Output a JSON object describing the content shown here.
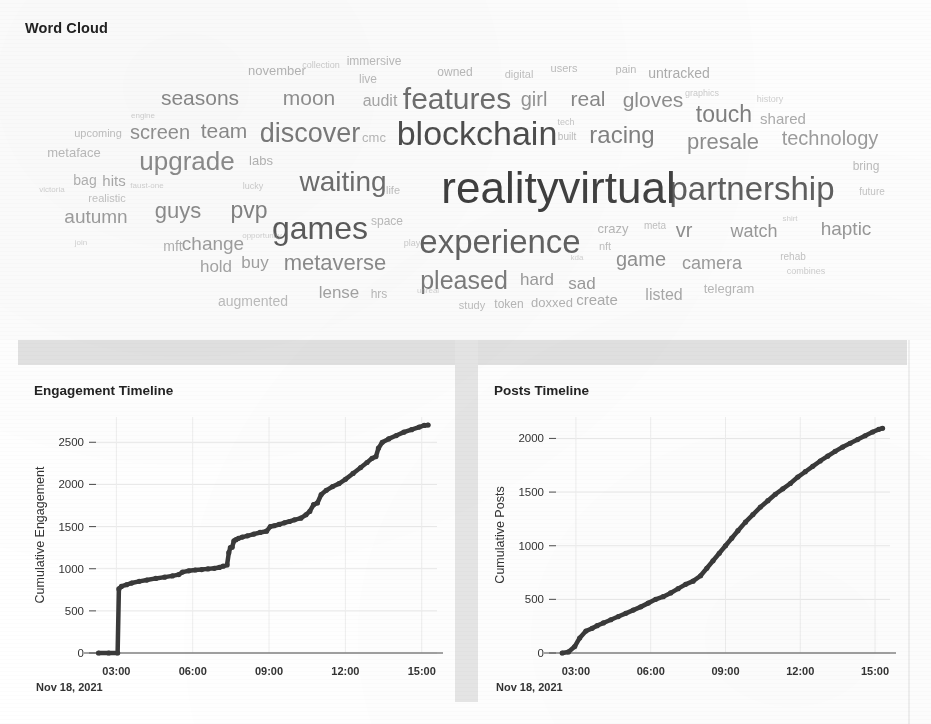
{
  "wordcloud": {
    "title": "Word Cloud",
    "words": [
      {
        "text": "reality",
        "size": 44,
        "x": 500,
        "y": 188,
        "w": 0.98,
        "c": "#3b3b3b"
      },
      {
        "text": "virtual",
        "size": 44,
        "x": 617,
        "y": 188,
        "w": 0.97,
        "c": "#3b3b3b"
      },
      {
        "text": "blockchain",
        "size": 34,
        "x": 477,
        "y": 133,
        "w": 0.92,
        "c": "#3f3f3f"
      },
      {
        "text": "partnership",
        "size": 33,
        "x": 752,
        "y": 188,
        "w": 0.88,
        "c": "#4a4a4a"
      },
      {
        "text": "experience",
        "size": 33,
        "x": 500,
        "y": 241,
        "w": 0.87,
        "c": "#4c4c4c"
      },
      {
        "text": "features",
        "size": 30,
        "x": 457,
        "y": 99,
        "w": 0.85,
        "c": "#565656"
      },
      {
        "text": "games",
        "size": 32,
        "x": 320,
        "y": 228,
        "w": 0.86,
        "c": "#414141"
      },
      {
        "text": "waiting",
        "size": 28,
        "x": 343,
        "y": 182,
        "w": 0.82,
        "c": "#4e4e4e"
      },
      {
        "text": "discover",
        "size": 27,
        "x": 310,
        "y": 133,
        "w": 0.8,
        "c": "#5a5a5a"
      },
      {
        "text": "upgrade",
        "size": 26,
        "x": 187,
        "y": 161,
        "w": 0.78,
        "c": "#6b6b6b"
      },
      {
        "text": "metaverse",
        "size": 22,
        "x": 335,
        "y": 263,
        "w": 0.72,
        "c": "#606060"
      },
      {
        "text": "pleased",
        "size": 25,
        "x": 464,
        "y": 280,
        "w": 0.74,
        "c": "#4f4f4f"
      },
      {
        "text": "technology",
        "size": 20,
        "x": 830,
        "y": 138,
        "w": 0.68,
        "c": "#6e6e6e"
      },
      {
        "text": "presale",
        "size": 22,
        "x": 723,
        "y": 142,
        "w": 0.7,
        "c": "#5e5e5e"
      },
      {
        "text": "racing",
        "size": 24,
        "x": 622,
        "y": 135,
        "w": 0.72,
        "c": "#525252"
      },
      {
        "text": "touch",
        "size": 23,
        "x": 724,
        "y": 114,
        "w": 0.71,
        "c": "#4d4d4d"
      },
      {
        "text": "gloves",
        "size": 21,
        "x": 653,
        "y": 99,
        "w": 0.69,
        "c": "#5c5c5c"
      },
      {
        "text": "seasons",
        "size": 21,
        "x": 200,
        "y": 97,
        "w": 0.7,
        "c": "#585858"
      },
      {
        "text": "screen",
        "size": 20,
        "x": 160,
        "y": 132,
        "w": 0.67,
        "c": "#5b5b5b"
      },
      {
        "text": "team",
        "size": 21,
        "x": 224,
        "y": 130,
        "w": 0.68,
        "c": "#555555"
      },
      {
        "text": "moon",
        "size": 21,
        "x": 309,
        "y": 97,
        "w": 0.68,
        "c": "#5c5c5c"
      },
      {
        "text": "guys",
        "size": 22,
        "x": 178,
        "y": 211,
        "w": 0.69,
        "c": "#5a5a5a"
      },
      {
        "text": "pvp",
        "size": 23,
        "x": 249,
        "y": 210,
        "w": 0.7,
        "c": "#4f4f4f"
      },
      {
        "text": "game",
        "size": 20,
        "x": 641,
        "y": 259,
        "w": 0.66,
        "c": "#595959"
      },
      {
        "text": "camera",
        "size": 18,
        "x": 712,
        "y": 263,
        "w": 0.64,
        "c": "#656565"
      },
      {
        "text": "haptic",
        "size": 19,
        "x": 846,
        "y": 228,
        "w": 0.64,
        "c": "#5e5e5e"
      },
      {
        "text": "watch",
        "size": 18,
        "x": 754,
        "y": 231,
        "w": 0.63,
        "c": "#5f5f5f"
      },
      {
        "text": "autumn",
        "size": 19,
        "x": 96,
        "y": 216,
        "w": 0.65,
        "c": "#6a6a6a"
      },
      {
        "text": "change",
        "size": 19,
        "x": 213,
        "y": 243,
        "w": 0.64,
        "c": "#6a6a6a"
      },
      {
        "text": "mft",
        "size": 14,
        "x": 173,
        "y": 246,
        "w": 0.58,
        "c": "#7a7a7a"
      },
      {
        "text": "buy",
        "size": 17,
        "x": 255,
        "y": 262,
        "w": 0.62,
        "c": "#6a6a6a"
      },
      {
        "text": "hold",
        "size": 17,
        "x": 216,
        "y": 266,
        "w": 0.62,
        "c": "#707070"
      },
      {
        "text": "lense",
        "size": 17,
        "x": 339,
        "y": 292,
        "w": 0.62,
        "c": "#6c6c6c"
      },
      {
        "text": "augmented",
        "size": 14,
        "x": 253,
        "y": 301,
        "w": 0.56,
        "c": "#8a8a8a"
      },
      {
        "text": "hard",
        "size": 17,
        "x": 537,
        "y": 279,
        "w": 0.62,
        "c": "#5e5e5e"
      },
      {
        "text": "sad",
        "size": 17,
        "x": 582,
        "y": 283,
        "w": 0.62,
        "c": "#5c5c5c"
      },
      {
        "text": "create",
        "size": 15,
        "x": 597,
        "y": 299,
        "w": 0.58,
        "c": "#717171"
      },
      {
        "text": "listed",
        "size": 16,
        "x": 664,
        "y": 295,
        "w": 0.6,
        "c": "#707070"
      },
      {
        "text": "telegram",
        "size": 13,
        "x": 729,
        "y": 288,
        "w": 0.55,
        "c": "#7d7d7d"
      },
      {
        "text": "doxxed",
        "size": 13,
        "x": 552,
        "y": 302,
        "w": 0.55,
        "c": "#777777"
      },
      {
        "text": "token",
        "size": 12,
        "x": 509,
        "y": 304,
        "w": 0.54,
        "c": "#7b7b7b"
      },
      {
        "text": "study",
        "size": 11,
        "x": 472,
        "y": 305,
        "w": 0.52,
        "c": "#858585"
      },
      {
        "text": "girl",
        "size": 20,
        "x": 534,
        "y": 99,
        "w": 0.66,
        "c": "#5d5d5d"
      },
      {
        "text": "real",
        "size": 21,
        "x": 588,
        "y": 98,
        "w": 0.68,
        "c": "#525252"
      },
      {
        "text": "audit",
        "size": 16,
        "x": 380,
        "y": 101,
        "w": 0.6,
        "c": "#6d6d6d"
      },
      {
        "text": "shared",
        "size": 15,
        "x": 783,
        "y": 118,
        "w": 0.58,
        "c": "#6f6f6f"
      },
      {
        "text": "untracked",
        "size": 14,
        "x": 679,
        "y": 73,
        "w": 0.56,
        "c": "#6d6d6d"
      },
      {
        "text": "november",
        "size": 13,
        "x": 277,
        "y": 70,
        "w": 0.55,
        "c": "#797979"
      },
      {
        "text": "immersive",
        "size": 12,
        "x": 374,
        "y": 61,
        "w": 0.54,
        "c": "#838383"
      },
      {
        "text": "live",
        "size": 12,
        "x": 368,
        "y": 79,
        "w": 0.54,
        "c": "#838383"
      },
      {
        "text": "owned",
        "size": 12,
        "x": 455,
        "y": 72,
        "w": 0.54,
        "c": "#7e7e7e"
      },
      {
        "text": "digital",
        "size": 11,
        "x": 519,
        "y": 74,
        "w": 0.52,
        "c": "#888888"
      },
      {
        "text": "users",
        "size": 11,
        "x": 564,
        "y": 68,
        "w": 0.52,
        "c": "#838383"
      },
      {
        "text": "pain",
        "size": 11,
        "x": 626,
        "y": 69,
        "w": 0.52,
        "c": "#7e7e7e"
      },
      {
        "text": "collection",
        "size": 9,
        "x": 321,
        "y": 65,
        "w": 0.5,
        "c": "#9a9a9a"
      },
      {
        "text": "graphics",
        "size": 9,
        "x": 702,
        "y": 93,
        "w": 0.5,
        "c": "#9a9a9a"
      },
      {
        "text": "history",
        "size": 9,
        "x": 770,
        "y": 99,
        "w": 0.5,
        "c": "#9e9e9e"
      },
      {
        "text": "tech",
        "size": 9,
        "x": 566,
        "y": 122,
        "w": 0.5,
        "c": "#8f8f8f"
      },
      {
        "text": "built",
        "size": 10,
        "x": 567,
        "y": 137,
        "w": 0.52,
        "c": "#838383"
      },
      {
        "text": "cmc",
        "size": 13,
        "x": 374,
        "y": 137,
        "w": 0.55,
        "c": "#7d7d7d"
      },
      {
        "text": "upcoming",
        "size": 11,
        "x": 98,
        "y": 133,
        "w": 0.52,
        "c": "#868686"
      },
      {
        "text": "metaface",
        "size": 13,
        "x": 74,
        "y": 152,
        "w": 0.54,
        "c": "#828282"
      },
      {
        "text": "engine",
        "size": 8,
        "x": 143,
        "y": 116,
        "w": 0.5,
        "c": "#a3a3a3"
      },
      {
        "text": "labs",
        "size": 13,
        "x": 261,
        "y": 160,
        "w": 0.56,
        "c": "#787878"
      },
      {
        "text": "bag",
        "size": 14,
        "x": 85,
        "y": 180,
        "w": 0.58,
        "c": "#7b7b7b"
      },
      {
        "text": "hits",
        "size": 15,
        "x": 114,
        "y": 180,
        "w": 0.58,
        "c": "#6f6f6f"
      },
      {
        "text": "faust-one",
        "size": 8,
        "x": 147,
        "y": 186,
        "w": 0.5,
        "c": "#a5a5a5"
      },
      {
        "text": "realistic",
        "size": 11,
        "x": 107,
        "y": 198,
        "w": 0.52,
        "c": "#8b8b8b"
      },
      {
        "text": "victoria",
        "size": 8,
        "x": 52,
        "y": 190,
        "w": 0.5,
        "c": "#a8a8a8"
      },
      {
        "text": "lucky",
        "size": 9,
        "x": 253,
        "y": 186,
        "w": 0.5,
        "c": "#9b9b9b"
      },
      {
        "text": "life",
        "size": 11,
        "x": 393,
        "y": 190,
        "w": 0.52,
        "c": "#858585"
      },
      {
        "text": "space",
        "size": 12,
        "x": 387,
        "y": 221,
        "w": 0.54,
        "c": "#828282"
      },
      {
        "text": "opportunity",
        "size": 8,
        "x": 262,
        "y": 236,
        "w": 0.5,
        "c": "#a5a5a5"
      },
      {
        "text": "join",
        "size": 8,
        "x": 81,
        "y": 243,
        "w": 0.5,
        "c": "#a8a8a8"
      },
      {
        "text": "play",
        "size": 9,
        "x": 412,
        "y": 243,
        "w": 0.5,
        "c": "#9a9a9a"
      },
      {
        "text": "crazy",
        "size": 13,
        "x": 613,
        "y": 228,
        "w": 0.55,
        "c": "#7d7d7d"
      },
      {
        "text": "meta",
        "size": 10,
        "x": 655,
        "y": 226,
        "w": 0.52,
        "c": "#8a8a8a"
      },
      {
        "text": "vr",
        "size": 20,
        "x": 684,
        "y": 230,
        "w": 0.66,
        "c": "#555555"
      },
      {
        "text": "shirt",
        "size": 8,
        "x": 790,
        "y": 219,
        "w": 0.5,
        "c": "#9f9f9f"
      },
      {
        "text": "nft",
        "size": 11,
        "x": 605,
        "y": 246,
        "w": 0.52,
        "c": "#868686"
      },
      {
        "text": "kda",
        "size": 8,
        "x": 577,
        "y": 258,
        "w": 0.5,
        "c": "#a6a6a6"
      },
      {
        "text": "unreal",
        "size": 8,
        "x": 428,
        "y": 291,
        "w": 0.5,
        "c": "#a6a6a6"
      },
      {
        "text": "hrs",
        "size": 12,
        "x": 379,
        "y": 294,
        "w": 0.54,
        "c": "#7f7f7f"
      },
      {
        "text": "rehab",
        "size": 10,
        "x": 793,
        "y": 257,
        "w": 0.52,
        "c": "#8c8c8c"
      },
      {
        "text": "combines",
        "size": 9,
        "x": 806,
        "y": 271,
        "w": 0.5,
        "c": "#9b9b9b"
      },
      {
        "text": "bring",
        "size": 12,
        "x": 866,
        "y": 166,
        "w": 0.54,
        "c": "#848484"
      },
      {
        "text": "future",
        "size": 10,
        "x": 872,
        "y": 192,
        "w": 0.52,
        "c": "#8f8f8f"
      }
    ]
  },
  "charts": [
    {
      "id": "engagement",
      "title": "Engagement Timeline",
      "chart_data": {
        "type": "line",
        "title": "Engagement Timeline",
        "xlabel": "",
        "ylabel": "Cumulative Engagement",
        "x_caption": "Nov 18, 2021",
        "xticks": [
          "03:00",
          "06:00",
          "09:00",
          "12:00",
          "15:00"
        ],
        "yticks": [
          0,
          500,
          1000,
          1500,
          2000,
          2500
        ],
        "xlim": [
          2.2,
          15.6
        ],
        "ylim": [
          0,
          2800
        ],
        "grid": true,
        "legend": "none",
        "series": [
          {
            "name": "Cumulative Engagement",
            "x": [
              2.3,
              2.7,
              3.05,
              3.1,
              3.2,
              3.4,
              3.6,
              3.9,
              4.2,
              4.55,
              4.9,
              5.2,
              5.45,
              5.6,
              5.85,
              6.1,
              6.35,
              6.6,
              6.85,
              7.05,
              7.2,
              7.35,
              7.42,
              7.48,
              7.55,
              7.62,
              7.7,
              7.8,
              7.95,
              8.15,
              8.4,
              8.65,
              8.9,
              9.05,
              9.2,
              9.4,
              9.6,
              9.8,
              10.0,
              10.25,
              10.45,
              10.6,
              10.75,
              10.9,
              11.05,
              11.25,
              11.5,
              11.75,
              12.0,
              12.3,
              12.6,
              12.85,
              13.05,
              13.2,
              13.3,
              13.45,
              13.7,
              14.0,
              14.3,
              14.6,
              14.9,
              15.1,
              15.25
            ],
            "y": [
              0,
              0,
              0,
              760,
              790,
              810,
              830,
              850,
              865,
              885,
              900,
              915,
              930,
              960,
              975,
              985,
              990,
              998,
              1005,
              1015,
              1030,
              1045,
              1190,
              1250,
              1255,
              1330,
              1345,
              1360,
              1375,
              1390,
              1410,
              1430,
              1445,
              1500,
              1510,
              1525,
              1545,
              1560,
              1580,
              1600,
              1640,
              1680,
              1760,
              1780,
              1880,
              1930,
              1975,
              2010,
              2060,
              2130,
              2200,
              2260,
              2310,
              2330,
              2430,
              2500,
              2540,
              2580,
              2620,
              2650,
              2680,
              2700,
              2705
            ]
          }
        ]
      }
    },
    {
      "id": "posts",
      "title": "Posts Timeline",
      "chart_data": {
        "type": "line",
        "title": "Posts Timeline",
        "xlabel": "",
        "ylabel": "Cumulative Posts",
        "x_caption": "Nov 18, 2021",
        "xticks": [
          "03:00",
          "06:00",
          "09:00",
          "12:00",
          "15:00"
        ],
        "yticks": [
          0,
          500,
          1000,
          1500,
          2000
        ],
        "xlim": [
          2.2,
          15.6
        ],
        "ylim": [
          0,
          2200
        ],
        "grid": true,
        "legend": "none",
        "series": [
          {
            "name": "Cumulative Posts",
            "x": [
              2.45,
              2.7,
              2.95,
              3.15,
              3.4,
              3.65,
              3.85,
              4.1,
              4.4,
              4.7,
              5.0,
              5.3,
              5.6,
              5.9,
              6.2,
              6.5,
              6.8,
              7.1,
              7.4,
              7.7,
              8.0,
              8.25,
              8.5,
              8.75,
              9.0,
              9.25,
              9.5,
              9.8,
              10.1,
              10.4,
              10.7,
              11.0,
              11.3,
              11.6,
              11.9,
              12.2,
              12.5,
              12.8,
              13.1,
              13.4,
              13.7,
              14.0,
              14.3,
              14.6,
              14.9,
              15.15,
              15.3
            ],
            "y": [
              0,
              10,
              60,
              140,
              205,
              230,
              255,
              280,
              310,
              340,
              370,
              400,
              430,
              465,
              500,
              525,
              560,
              600,
              640,
              670,
              720,
              790,
              860,
              930,
              1000,
              1070,
              1140,
              1220,
              1290,
              1360,
              1420,
              1480,
              1530,
              1580,
              1640,
              1690,
              1740,
              1790,
              1835,
              1880,
              1920,
              1955,
              1990,
              2025,
              2060,
              2085,
              2095
            ]
          }
        ]
      }
    }
  ]
}
